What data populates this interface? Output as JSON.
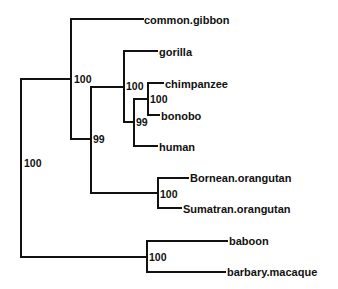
{
  "diagram": {
    "type": "phylogenetic-tree",
    "taxa": [
      {
        "id": "gibbon",
        "label": "common.gibbon",
        "x": 144,
        "y": 20
      },
      {
        "id": "gorilla",
        "label": "gorilla",
        "x": 159,
        "y": 52
      },
      {
        "id": "chimp",
        "label": "chimpanzee",
        "x": 165,
        "y": 84
      },
      {
        "id": "bonobo",
        "label": "bonobo",
        "x": 161,
        "y": 116
      },
      {
        "id": "human",
        "label": "human",
        "x": 159,
        "y": 147
      },
      {
        "id": "bornean",
        "label": "Bornean.orangutan",
        "x": 190,
        "y": 178
      },
      {
        "id": "sumatran",
        "label": "Sumatran.orangutan",
        "x": 183,
        "y": 209
      },
      {
        "id": "baboon",
        "label": "baboon",
        "x": 229,
        "y": 241
      },
      {
        "id": "macaque",
        "label": "barbary.macaque",
        "x": 227,
        "y": 272
      }
    ],
    "support_values": [
      {
        "node": "root",
        "label": "100",
        "x": 24,
        "y": 167
      },
      {
        "node": "hominoidea",
        "label": "100",
        "x": 74,
        "y": 83
      },
      {
        "node": "hominidae",
        "label": "99",
        "x": 93,
        "y": 143
      },
      {
        "node": "homininae",
        "label": "100",
        "x": 126,
        "y": 90
      },
      {
        "node": "hominini",
        "label": "99",
        "x": 136,
        "y": 126
      },
      {
        "node": "pan",
        "label": "100",
        "x": 150,
        "y": 103
      },
      {
        "node": "pongo",
        "label": "100",
        "x": 160,
        "y": 198
      },
      {
        "node": "papionini",
        "label": "100",
        "x": 149,
        "y": 261
      }
    ],
    "branches": [
      "M21 79 L21 257",
      "M21 79 L71 79",
      "M21 257 L147 257",
      "M71 19 L71 139",
      "M71 19 L143 19",
      "M71 139 L91 139",
      "M91 87 L91 193",
      "M91 87 L124 87",
      "M91 193 L158 193",
      "M124 51 L124 122",
      "M124 51 L157 51",
      "M124 122 L134 122",
      "M134 99 L134 146",
      "M134 99 L148 99",
      "M134 146 L157 146",
      "M148 83 L148 115",
      "M148 83 L163 83",
      "M148 115 L159 115",
      "M158 178 L158 208",
      "M158 178 L188 178",
      "M158 208 L181 208",
      "M147 241 L147 272",
      "M147 241 L227 241",
      "M147 272 L225 272"
    ]
  }
}
